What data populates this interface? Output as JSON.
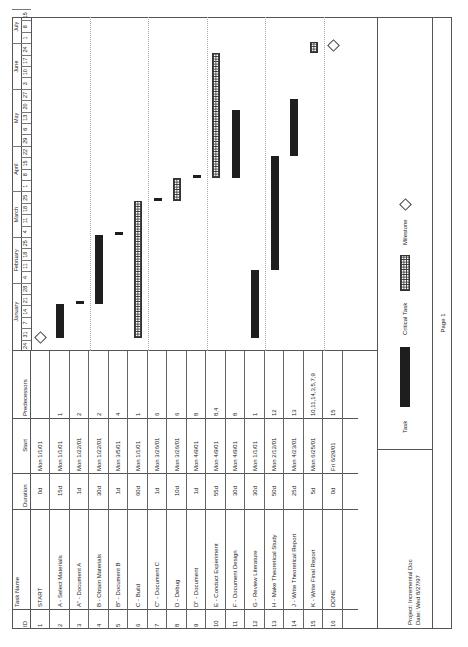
{
  "table": {
    "headers": {
      "id": "ID",
      "task_name": "Task Name",
      "duration": "Duration",
      "start": "Start",
      "predecessors": "Predecessors"
    },
    "rows": [
      {
        "id": "1",
        "name": "START",
        "duration": "0d",
        "start": "Mon 1/1/01",
        "pred": ""
      },
      {
        "id": "2",
        "name": "A - Select Materials",
        "duration": "15d",
        "start": "Mon 1/1/01",
        "pred": "1"
      },
      {
        "id": "3",
        "name": "A\" - Document A",
        "duration": "1d",
        "start": "Mon 1/22/01",
        "pred": "2"
      },
      {
        "id": "4",
        "name": "B - Obtain Materials",
        "duration": "30d",
        "start": "Mon 1/22/01",
        "pred": "2"
      },
      {
        "id": "5",
        "name": "B\" - Document B",
        "duration": "1d",
        "start": "Mon 3/5/01",
        "pred": "4"
      },
      {
        "id": "6",
        "name": "C - Build",
        "duration": "60d",
        "start": "Mon 1/1/01",
        "pred": "1"
      },
      {
        "id": "7",
        "name": "C\" - Document C",
        "duration": "1d",
        "start": "Mon 3/26/01",
        "pred": "6"
      },
      {
        "id": "8",
        "name": "D - Debug",
        "duration": "10d",
        "start": "Mon 3/26/01",
        "pred": "6"
      },
      {
        "id": "9",
        "name": "D\" - Document",
        "duration": "1d",
        "start": "Mon 4/9/01",
        "pred": "8"
      },
      {
        "id": "10",
        "name": "E - Conduct Experiment",
        "duration": "55d",
        "start": "Mon 4/9/01",
        "pred": "8,4"
      },
      {
        "id": "11",
        "name": "F - Document Design",
        "duration": "30d",
        "start": "Mon 4/9/01",
        "pred": "8"
      },
      {
        "id": "12",
        "name": "G - Review Literature",
        "duration": "30d",
        "start": "Mon 1/1/01",
        "pred": "1"
      },
      {
        "id": "13",
        "name": "H - Make Theoretical Study",
        "duration": "50d",
        "start": "Mon 2/12/01",
        "pred": "12"
      },
      {
        "id": "14",
        "name": "J - Write Theoretical Report",
        "duration": "25d",
        "start": "Mon 4/23/01",
        "pred": "13"
      },
      {
        "id": "15",
        "name": "K - Write Final Report",
        "duration": "5d",
        "start": "Mon 6/25/01",
        "pred": "10,11,14,3,5,7,9"
      },
      {
        "id": "16",
        "name": "DONE",
        "duration": "0d",
        "start": "Fri 6/29/01",
        "pred": "15"
      }
    ]
  },
  "timescale": {
    "months": [
      {
        "label": "January",
        "start_week": 1,
        "span": 5
      },
      {
        "label": "February",
        "start_week": 6,
        "span": 4
      },
      {
        "label": "March",
        "start_week": 10,
        "span": 4
      },
      {
        "label": "April",
        "start_week": 14,
        "span": 4
      },
      {
        "label": "May",
        "start_week": 18,
        "span": 5
      },
      {
        "label": "June",
        "start_week": 23,
        "span": 4
      },
      {
        "label": "July",
        "start_week": 27,
        "span": 3
      }
    ],
    "weeks": [
      "24",
      "31",
      "7",
      "14",
      "21",
      "28",
      "4",
      "11",
      "18",
      "25",
      "4",
      "11",
      "18",
      "25",
      "1",
      "8",
      "15",
      "22",
      "29",
      "6",
      "13",
      "20",
      "27",
      "3",
      "10",
      "17",
      "24",
      "1",
      "8",
      "15"
    ]
  },
  "legend": {
    "project": "Project: Incremental Doc",
    "date": "Date: Wed 8/27/97",
    "task": "Task",
    "critical_task": "Critical Task",
    "milestone": "Milestone",
    "page": "Page 1"
  },
  "chart_data": {
    "type": "gantt",
    "title": "Incremental Doc",
    "x_axis": "Dec 24, 2000 – Jul 21, 2001 (weekly)",
    "tasks": [
      {
        "id": 1,
        "name": "START",
        "start": "2001-01-01",
        "duration_days": 0,
        "kind": "milestone"
      },
      {
        "id": 2,
        "name": "A - Select Materials",
        "start": "2001-01-01",
        "duration_days": 15,
        "kind": "task"
      },
      {
        "id": 3,
        "name": "A\" - Document A",
        "start": "2001-01-22",
        "duration_days": 1,
        "kind": "task"
      },
      {
        "id": 4,
        "name": "B - Obtain Materials",
        "start": "2001-01-22",
        "duration_days": 30,
        "kind": "task"
      },
      {
        "id": 5,
        "name": "B\" - Document B",
        "start": "2001-03-05",
        "duration_days": 1,
        "kind": "task"
      },
      {
        "id": 6,
        "name": "C - Build",
        "start": "2001-01-01",
        "duration_days": 60,
        "kind": "critical"
      },
      {
        "id": 7,
        "name": "C\" - Document C",
        "start": "2001-03-26",
        "duration_days": 1,
        "kind": "task"
      },
      {
        "id": 8,
        "name": "D - Debug",
        "start": "2001-03-26",
        "duration_days": 10,
        "kind": "critical"
      },
      {
        "id": 9,
        "name": "D\" - Document",
        "start": "2001-04-09",
        "duration_days": 1,
        "kind": "task"
      },
      {
        "id": 10,
        "name": "E - Conduct Experiment",
        "start": "2001-04-09",
        "duration_days": 55,
        "kind": "critical"
      },
      {
        "id": 11,
        "name": "F - Document Design",
        "start": "2001-04-09",
        "duration_days": 30,
        "kind": "task"
      },
      {
        "id": 12,
        "name": "G - Review Literature",
        "start": "2001-01-01",
        "duration_days": 30,
        "kind": "task"
      },
      {
        "id": 13,
        "name": "H - Make Theoretical Study",
        "start": "2001-02-12",
        "duration_days": 50,
        "kind": "task"
      },
      {
        "id": 14,
        "name": "J - Write Theoretical Report",
        "start": "2001-04-23",
        "duration_days": 25,
        "kind": "task"
      },
      {
        "id": 15,
        "name": "K - Write Final Report",
        "start": "2001-06-25",
        "duration_days": 5,
        "kind": "critical"
      },
      {
        "id": 16,
        "name": "DONE",
        "start": "2001-06-29",
        "duration_days": 0,
        "kind": "milestone"
      }
    ]
  }
}
